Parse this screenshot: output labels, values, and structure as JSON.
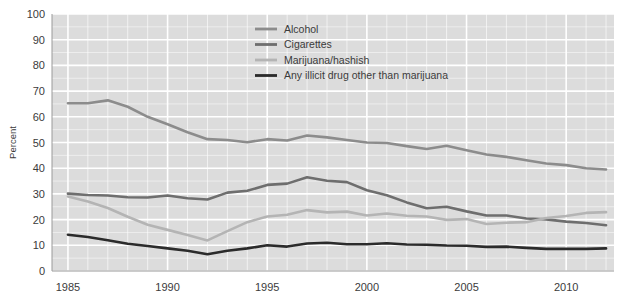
{
  "chart_data": {
    "type": "line",
    "title": "",
    "subtitle": "",
    "xlabel": "",
    "ylabel": "Percent",
    "xlim": [
      1984.2,
      2012.4
    ],
    "ylim": [
      0,
      100
    ],
    "ytick_step": 10,
    "yticks": [
      0,
      10,
      20,
      30,
      40,
      50,
      60,
      70,
      80,
      90,
      100
    ],
    "ytick_labels": [
      "0",
      "10",
      "20",
      "30",
      "40",
      "50",
      "60",
      "70",
      "80",
      "90",
      "100"
    ],
    "xticks": [
      1985,
      1990,
      1995,
      2000,
      2005,
      2010
    ],
    "xtick_labels": [
      "1985",
      "1990",
      "1995",
      "2000",
      "2005",
      "2010"
    ],
    "x_minor_step": 1,
    "grid": true,
    "grid_color": "#ffffff",
    "plot_background": "#dcdcdc",
    "legend_position": "top-center-right",
    "x": [
      1985,
      1986,
      1987,
      1988,
      1989,
      1990,
      1991,
      1992,
      1993,
      1994,
      1995,
      1996,
      1997,
      1998,
      1999,
      2000,
      2001,
      2002,
      2003,
      2004,
      2005,
      2006,
      2007,
      2008,
      2009,
      2010,
      2011,
      2012
    ],
    "series": [
      {
        "name": "Alcohol",
        "color": "#8c8c8c",
        "width": 2.6,
        "values": [
          65.3,
          65.3,
          66.4,
          63.9,
          60.0,
          57.1,
          54.0,
          51.3,
          51.0,
          50.1,
          51.3,
          50.8,
          52.7,
          52.0,
          51.0,
          50.0,
          49.8,
          48.6,
          47.5,
          48.7,
          47.0,
          45.3,
          44.4,
          43.1,
          41.8,
          41.2,
          40.0,
          39.5
        ]
      },
      {
        "name": "Cigarettes",
        "color": "#6e6e6e",
        "width": 2.6,
        "values": [
          30.1,
          29.6,
          29.4,
          28.7,
          28.6,
          29.4,
          28.3,
          27.8,
          30.5,
          31.2,
          33.5,
          34.0,
          36.5,
          35.1,
          34.6,
          31.4,
          29.5,
          26.7,
          24.4,
          25.0,
          23.2,
          21.6,
          21.6,
          20.4,
          20.1,
          19.2,
          18.7,
          17.8
        ]
      },
      {
        "name": "Marijuana/hashish",
        "color": "#b4b4b4",
        "width": 2.6,
        "values": [
          29.0,
          27.0,
          24.5,
          21.1,
          18.0,
          16.0,
          14.0,
          11.9,
          15.5,
          19.0,
          21.2,
          21.9,
          23.7,
          22.8,
          23.1,
          21.6,
          22.4,
          21.5,
          21.2,
          19.9,
          20.2,
          18.3,
          18.8,
          19.0,
          20.6,
          21.4,
          22.6,
          22.9
        ]
      },
      {
        "name": "Any illicit drug other than marijuana",
        "color": "#2b2b2b",
        "width": 2.6,
        "values": [
          14.1,
          13.2,
          12.0,
          10.6,
          9.7,
          8.8,
          7.9,
          6.5,
          7.9,
          8.8,
          10.0,
          9.5,
          10.7,
          11.0,
          10.4,
          10.4,
          10.8,
          10.3,
          10.2,
          9.9,
          9.8,
          9.4,
          9.5,
          9.0,
          8.6,
          8.6,
          8.6,
          8.8
        ]
      }
    ],
    "legend": [
      {
        "label": "Alcohol",
        "color": "#8c8c8c"
      },
      {
        "label": "Cigarettes",
        "color": "#6e6e6e"
      },
      {
        "label": "Marijuana/hashish",
        "color": "#b4b4b4"
      },
      {
        "label": "Any illicit drug other than marijuana",
        "color": "#2b2b2b"
      }
    ]
  }
}
